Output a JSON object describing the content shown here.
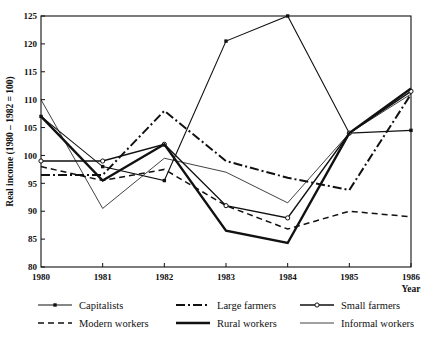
{
  "chart_data": {
    "type": "line",
    "title": "",
    "xlabel": "Year",
    "ylabel": "Real income (1980 – 1982 = 100)",
    "x": [
      1980,
      1981,
      1982,
      1983,
      1984,
      1985,
      1986
    ],
    "xticklabels": [
      "1980",
      "1981",
      "1982",
      "1983",
      "1984",
      "1985",
      "1986"
    ],
    "yticklabels": [
      "80",
      "85",
      "90",
      "95",
      "100",
      "105",
      "110",
      "115",
      "120",
      "125"
    ],
    "yticks": [
      80,
      85,
      90,
      95,
      100,
      105,
      110,
      115,
      120,
      125
    ],
    "xlim": [
      1980,
      1986
    ],
    "ylim": [
      80,
      125
    ],
    "grid": false,
    "legend_position": "below",
    "series": [
      {
        "name": "Capitalists",
        "style": "solid-dot-marker",
        "marker": "filled-dot",
        "values": [
          107.0,
          98.0,
          95.5,
          120.5,
          125.0,
          104.0,
          104.5
        ]
      },
      {
        "name": "Large farmers",
        "style": "dash-dot",
        "marker": "none",
        "values": [
          96.5,
          96.5,
          108.0,
          99.0,
          96.0,
          93.8,
          111.0
        ]
      },
      {
        "name": "Small farmers",
        "style": "solid-open-circle",
        "marker": "open-circle",
        "values": [
          99.0,
          99.0,
          102.0,
          91.0,
          88.8,
          104.0,
          111.5
        ]
      },
      {
        "name": "Modern workers",
        "style": "dashed",
        "marker": "none",
        "values": [
          98.0,
          95.5,
          97.5,
          91.0,
          86.8,
          90.0,
          89.0
        ]
      },
      {
        "name": "Rural workers",
        "style": "thick-solid",
        "marker": "none",
        "values": [
          107.0,
          95.5,
          102.0,
          86.5,
          84.3,
          104.0,
          112.0
        ]
      },
      {
        "name": "Informal workers",
        "style": "thin-solid",
        "marker": "none",
        "values": [
          110.0,
          90.5,
          99.5,
          97.0,
          91.5,
          104.0,
          111.0
        ]
      }
    ]
  },
  "legend": {
    "entries": [
      {
        "label": "Capitalists",
        "style": "solid-dot-marker"
      },
      {
        "label": "Large farmers",
        "style": "dash-dot"
      },
      {
        "label": "Small farmers",
        "style": "solid-open-circle"
      },
      {
        "label": "Modern workers",
        "style": "dashed"
      },
      {
        "label": "Rural workers",
        "style": "thick-solid"
      },
      {
        "label": "Informal workers",
        "style": "thin-solid"
      }
    ]
  }
}
